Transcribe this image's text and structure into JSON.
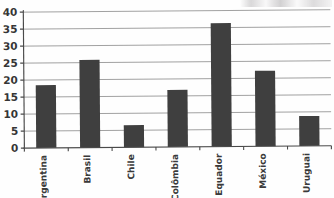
{
  "chart_data": {
    "type": "bar",
    "title": "",
    "subtitle": "",
    "xlabel": "",
    "ylabel": "",
    "categories": [
      "Argentina",
      "Brasil",
      "Chile",
      "Colômbia",
      "Equador",
      "México",
      "Uruguai"
    ],
    "values": [
      18.5,
      25.8,
      6.5,
      16.8,
      36.3,
      22.2,
      8.8
    ],
    "ylim": [
      0,
      40
    ],
    "ytick_labels": [
      "0",
      "5",
      "10",
      "15",
      "20",
      "25",
      "30",
      "35",
      "40"
    ],
    "ytick_values": [
      0,
      5,
      10,
      15,
      20,
      25,
      30,
      35,
      40
    ],
    "grid": true,
    "legend": false,
    "legend_position": "none",
    "bar_color": "#3f3f3f",
    "gridline_color": "#8a8a8a",
    "axis_color": "#4a4a4a",
    "background_color": "#fefefe",
    "xtick_rotation": -90
  },
  "axes": {
    "y_axis_name": "y-axis",
    "x_axis_name": "x-axis"
  }
}
